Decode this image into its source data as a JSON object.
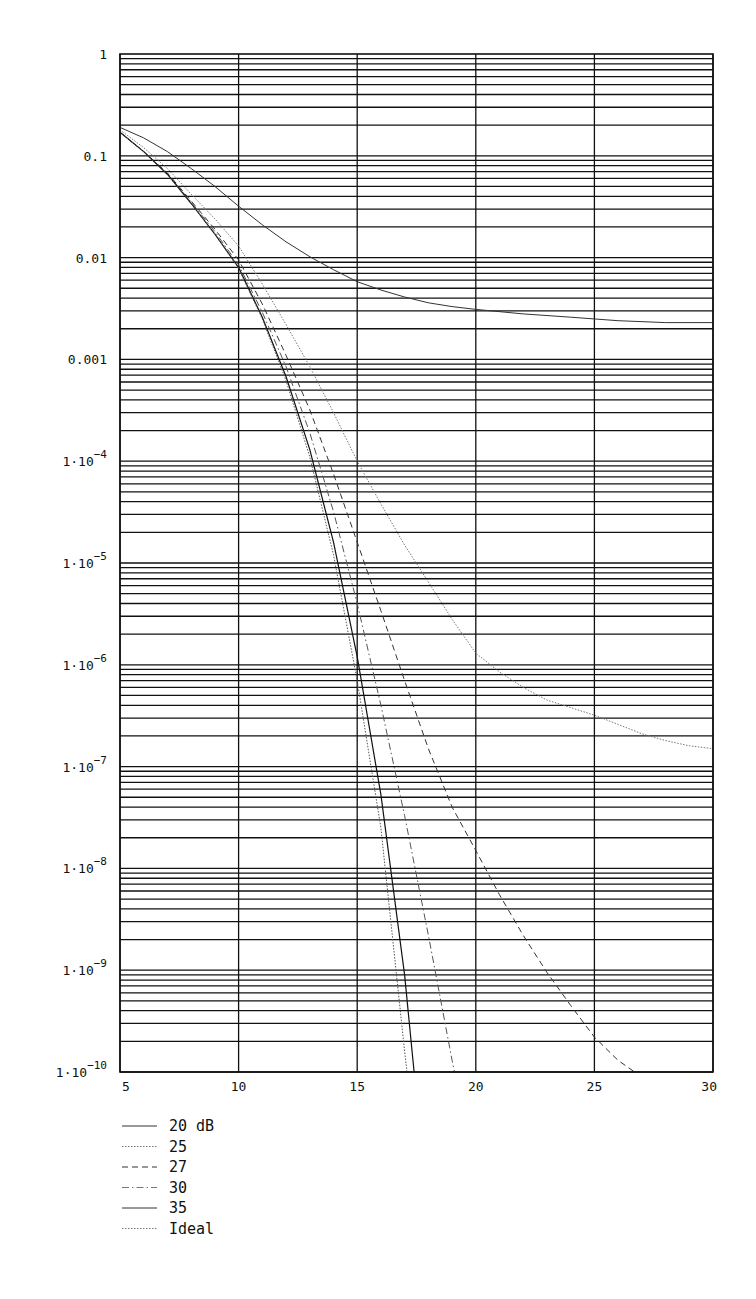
{
  "chart_data": {
    "type": "line",
    "title": "",
    "xlabel": "",
    "ylabel": "",
    "xscale": "linear",
    "yscale": "log",
    "xlim": [
      5,
      30
    ],
    "ylim": [
      1e-10,
      1
    ],
    "grid": true,
    "x_ticks": [
      5,
      10,
      15,
      20,
      25,
      30
    ],
    "x_tick_labels": [
      "5",
      "10",
      "15",
      "20",
      "25",
      "30"
    ],
    "y_ticks": [
      1,
      0.1,
      0.01,
      0.001,
      0.0001,
      1e-05,
      1e-06,
      1e-07,
      1e-08,
      1e-09,
      1e-10
    ],
    "y_tick_labels": [
      {
        "mantissa": "1",
        "exp": ""
      },
      {
        "mantissa": "0.1",
        "exp": ""
      },
      {
        "mantissa": "0.01",
        "exp": ""
      },
      {
        "mantissa": "0.001",
        "exp": ""
      },
      {
        "mantissa": "1·10",
        "exp": "−4"
      },
      {
        "mantissa": "1·10",
        "exp": "−5"
      },
      {
        "mantissa": "1·10",
        "exp": "−6"
      },
      {
        "mantissa": "1·10",
        "exp": "−7"
      },
      {
        "mantissa": "1·10",
        "exp": "−8"
      },
      {
        "mantissa": "1·10",
        "exp": "−9"
      },
      {
        "mantissa": "1·10",
        "exp": "−10"
      }
    ],
    "legend_position": "below-left",
    "series": [
      {
        "name": "20 dB",
        "style": "solid",
        "color": "#333333",
        "width": 1.0,
        "x": [
          5,
          6,
          7,
          8,
          9,
          10,
          11,
          12,
          13,
          14,
          15,
          16,
          17,
          18,
          19,
          20,
          22,
          24,
          26,
          28,
          30
        ],
        "y": [
          0.19,
          0.15,
          0.11,
          0.075,
          0.05,
          0.032,
          0.021,
          0.0143,
          0.0102,
          0.0076,
          0.0058,
          0.0048,
          0.0041,
          0.0036,
          0.0033,
          0.0031,
          0.0028,
          0.0026,
          0.0024,
          0.0023,
          0.0023
        ]
      },
      {
        "name": "25",
        "style": "dotted",
        "color": "#777777",
        "width": 1.0,
        "x": [
          5,
          6,
          7,
          8,
          9,
          10,
          11,
          12,
          13,
          14,
          15,
          16,
          17,
          18,
          19,
          20,
          21,
          22,
          23,
          24,
          25,
          26,
          27,
          28,
          29,
          30
        ],
        "y": [
          0.18,
          0.12,
          0.075,
          0.042,
          0.024,
          0.013,
          0.0055,
          0.0022,
          0.00085,
          0.0003,
          0.0001,
          3.8e-05,
          1.5e-05,
          6.5e-06,
          2.8e-06,
          1.3e-06,
          8.5e-07,
          6e-07,
          4.5e-07,
          3.8e-07,
          3.2e-07,
          2.6e-07,
          2.1e-07,
          1.8e-07,
          1.6e-07,
          1.5e-07
        ]
      },
      {
        "name": "27",
        "style": "dashed",
        "color": "#333333",
        "width": 1.0,
        "x": [
          5,
          6,
          7,
          8,
          9,
          10,
          11,
          12,
          13,
          14,
          15,
          16,
          17,
          18,
          19,
          20,
          21,
          22,
          23,
          24,
          25,
          26,
          26.7
        ],
        "y": [
          0.17,
          0.11,
          0.068,
          0.036,
          0.019,
          0.0095,
          0.0035,
          0.0011,
          0.00032,
          7.5e-05,
          1.6e-05,
          3.4e-06,
          7e-07,
          1.5e-07,
          4e-08,
          1.5e-08,
          5.5e-09,
          2.2e-09,
          9.5e-10,
          4.5e-10,
          2.2e-10,
          1.3e-10,
          1e-10
        ]
      },
      {
        "name": "30",
        "style": "dashdot",
        "color": "#555555",
        "width": 1.0,
        "x": [
          5,
          6,
          7,
          8,
          9,
          10,
          11,
          12,
          13,
          14,
          15,
          16,
          17,
          18,
          19,
          19.1
        ],
        "y": [
          0.17,
          0.11,
          0.066,
          0.035,
          0.018,
          0.0085,
          0.0029,
          0.00085,
          0.00019,
          3.2e-05,
          4e-06,
          4e-07,
          3.3e-08,
          2.2e-09,
          1.3e-10,
          1e-10
        ]
      },
      {
        "name": "35",
        "style": "solid",
        "color": "#111111",
        "width": 1.2,
        "x": [
          5,
          6,
          7,
          8,
          9,
          10,
          11,
          12,
          13,
          14,
          15,
          16,
          17,
          17.4
        ],
        "y": [
          0.17,
          0.11,
          0.066,
          0.034,
          0.017,
          0.008,
          0.0026,
          0.00068,
          0.00013,
          1.6e-05,
          1.2e-06,
          5.3e-08,
          9e-10,
          1e-10
        ]
      },
      {
        "name": "Ideal",
        "style": "dotted",
        "color": "#555555",
        "width": 1.0,
        "x": [
          5,
          6,
          7,
          8,
          9,
          10,
          11,
          12,
          13,
          14,
          15,
          16,
          17,
          17.1
        ],
        "y": [
          0.17,
          0.11,
          0.065,
          0.034,
          0.017,
          0.0078,
          0.0025,
          0.00062,
          0.00011,
          1.2e-05,
          7e-07,
          2.5e-08,
          1.6e-10,
          1e-10
        ]
      }
    ]
  },
  "legend": {
    "items": [
      {
        "label": "20 dB",
        "style": "solid"
      },
      {
        "label": "25",
        "style": "dotted"
      },
      {
        "label": "27",
        "style": "dashed"
      },
      {
        "label": "30",
        "style": "dashdot"
      },
      {
        "label": "35",
        "style": "solid"
      },
      {
        "label": "Ideal",
        "style": "dotted"
      }
    ]
  }
}
